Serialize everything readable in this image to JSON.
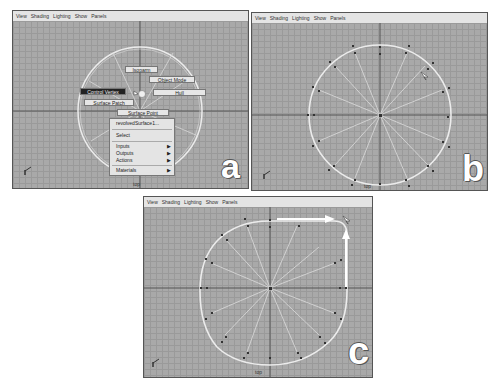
{
  "menu": [
    "View",
    "Shading",
    "Lighting",
    "Show",
    "Panels"
  ],
  "camera_label": "top",
  "panels": {
    "a": {
      "letter": "a",
      "marking_menu": {
        "buttons": [
          {
            "label": "Isoparm"
          },
          {
            "label": "Object Mode"
          },
          {
            "label": "Control Vertex"
          },
          {
            "label": "Hull"
          },
          {
            "label": "Surface Patch"
          },
          {
            "label": "Surface Point"
          }
        ],
        "active": "Control Vertex"
      },
      "context_menu": {
        "items": [
          {
            "label": "revolvedSurface1...",
            "submenu": false
          },
          {
            "label": "Select",
            "submenu": false
          },
          {
            "label": "Inputs",
            "submenu": true
          },
          {
            "label": "Outputs",
            "submenu": true
          },
          {
            "label": "Actions",
            "submenu": true
          },
          {
            "label": "Materials",
            "submenu": true
          }
        ]
      }
    },
    "b": {
      "letter": "b"
    },
    "c": {
      "letter": "c"
    }
  },
  "icons": {
    "submenu_arrow": "▶",
    "axis_indicator": "axis-gizmo-icon",
    "cursor": "arrow-cursor-icon"
  },
  "colors": {
    "viewport_bg": "#a9a9a9",
    "grid_line": "#9a9a9a",
    "axis_line": "#555555",
    "surface_wire": "#e8e8e8",
    "menu_bg": "#e4e4e4",
    "active_button": "#222222"
  }
}
